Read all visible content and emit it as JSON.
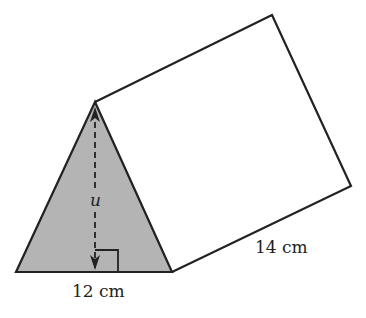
{
  "figure": {
    "type": "triangular prism",
    "labels": {
      "height_var": "u",
      "base": "12 cm",
      "length": "14 cm"
    },
    "colors": {
      "face_fill": "#b4b4b4",
      "stroke": "#222222",
      "background": "#ffffff"
    }
  }
}
